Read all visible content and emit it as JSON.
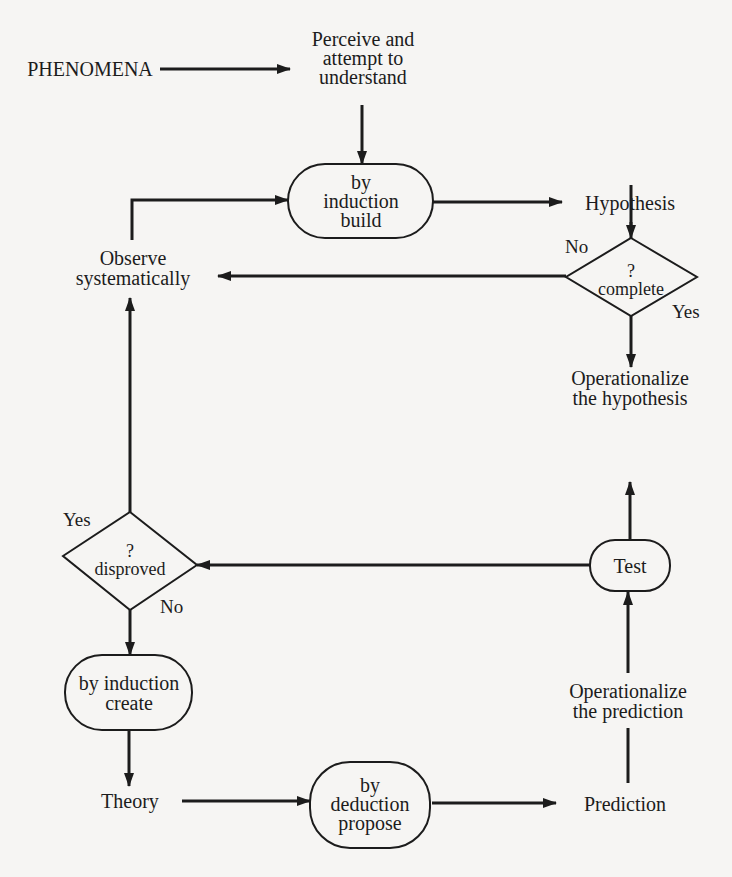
{
  "diagram": {
    "type": "flowchart",
    "colors": {
      "background": "#f6f5f3",
      "ink": "#1c1c1c"
    },
    "nodes": {
      "phenomena": {
        "label": "PHENOMENA",
        "shape": "text"
      },
      "perceive": {
        "lines": [
          "Perceive and",
          "attempt to",
          "understand"
        ],
        "shape": "text"
      },
      "induction_build": {
        "lines": [
          "by",
          "induction",
          "build"
        ],
        "shape": "stadium"
      },
      "hypothesis": {
        "label": "Hypothesis",
        "shape": "text"
      },
      "complete": {
        "lines": [
          "?",
          "complete"
        ],
        "shape": "diamond"
      },
      "observe": {
        "lines": [
          "Observe",
          "systematically"
        ],
        "shape": "text"
      },
      "op_hypothesis": {
        "lines": [
          "Operationalize",
          "the hypothesis"
        ],
        "shape": "text"
      },
      "test": {
        "label": "Test",
        "shape": "stadium"
      },
      "disproved": {
        "lines": [
          "?",
          "disproved"
        ],
        "shape": "diamond"
      },
      "induction_create": {
        "lines": [
          "by induction",
          "create"
        ],
        "shape": "stadium"
      },
      "theory": {
        "label": "Theory",
        "shape": "text"
      },
      "deduction_propose": {
        "lines": [
          "by",
          "deduction",
          "propose"
        ],
        "shape": "stadium"
      },
      "prediction": {
        "label": "Prediction",
        "shape": "text"
      },
      "op_prediction": {
        "lines": [
          "Operationalize",
          "the prediction"
        ],
        "shape": "text"
      }
    },
    "edge_labels": {
      "complete_no": "No",
      "complete_yes": "Yes",
      "disproved_yes": "Yes",
      "disproved_no": "No"
    },
    "edges": [
      {
        "from": "PHENOMENA",
        "to": "Perceive and attempt to understand"
      },
      {
        "from": "Perceive and attempt to understand",
        "to": "by induction build"
      },
      {
        "from": "by induction build",
        "to": "Hypothesis"
      },
      {
        "from": "Hypothesis",
        "to": "? complete"
      },
      {
        "from": "? complete",
        "to": "Observe systematically",
        "label": "No"
      },
      {
        "from": "? complete",
        "to": "Operationalize the hypothesis",
        "label": "Yes"
      },
      {
        "from": "Observe systematically",
        "to": "by induction build"
      },
      {
        "from": "Test",
        "to": "Operationalize the hypothesis"
      },
      {
        "from": "Test",
        "to": "? disproved"
      },
      {
        "from": "? disproved",
        "to": "Observe systematically",
        "label": "Yes"
      },
      {
        "from": "? disproved",
        "to": "by induction create",
        "label": "No"
      },
      {
        "from": "by induction create",
        "to": "Theory"
      },
      {
        "from": "Theory",
        "to": "by deduction propose"
      },
      {
        "from": "by deduction propose",
        "to": "Prediction"
      },
      {
        "from": "Prediction",
        "to": "Operationalize the prediction"
      },
      {
        "from": "Operationalize the prediction",
        "to": "Test"
      }
    ]
  }
}
